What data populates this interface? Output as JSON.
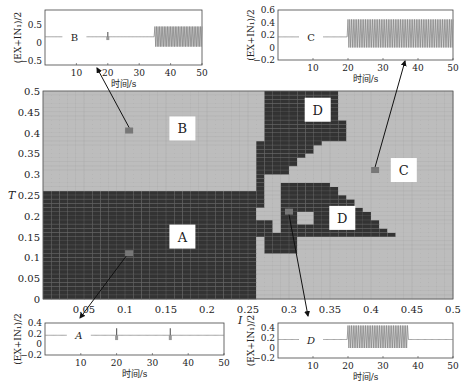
{
  "chart_data": [
    {
      "id": "main",
      "type": "heatmap",
      "title": "",
      "xlabel": "I",
      "ylabel": "T",
      "xlim": [
        0,
        0.5
      ],
      "ylim": [
        0,
        0.5
      ],
      "xticks": [
        "0.05",
        "0.1",
        "0.15",
        "0.2",
        "0.25",
        "0.3",
        "0.35",
        "0.4",
        "0.45",
        "0.5"
      ],
      "yticks": [
        "0",
        "0.05",
        "0.1",
        "0.15",
        "0.2",
        "0.25",
        "0.3",
        "0.35",
        "0.4",
        "0.45",
        "0.5"
      ],
      "grid": true,
      "colors": {
        "light": "#bdbdbd",
        "dark": "#333333",
        "marker": "#777777",
        "grid": "#9a9a9a"
      },
      "regions": [
        {
          "label": "A",
          "description": "dark region, I 0–0.26, T 0–0.26",
          "label_pos": [
            0.17,
            0.15
          ]
        },
        {
          "label": "B",
          "description": "light region, I 0–0.26, T 0.26–0.5",
          "label_pos": [
            0.17,
            0.41
          ]
        },
        {
          "label": "C",
          "description": "light region right side",
          "label_pos": [
            0.44,
            0.31
          ]
        },
        {
          "label": "D",
          "description": "dark upper blob, I ~0.27–0.37, T ~0.28–0.5",
          "label_pos": [
            0.335,
            0.455
          ]
        },
        {
          "label": "D",
          "description": "dark lower triangle, I ~0.29–0.43, T ~0.14–0.28",
          "label_pos": [
            0.365,
            0.195
          ]
        }
      ],
      "markers": [
        {
          "for": "B",
          "I": 0.105,
          "T": 0.405
        },
        {
          "for": "C",
          "I": 0.405,
          "T": 0.31
        },
        {
          "for": "D",
          "I": 0.3,
          "T": 0.21
        },
        {
          "for": "A",
          "I": 0.105,
          "T": 0.11
        }
      ]
    },
    {
      "id": "inset-B",
      "type": "line",
      "label": "B",
      "xlabel": "时间/s",
      "ylabel": "(EX+IN₁)/2",
      "xlim": [
        0,
        50
      ],
      "ylim": [
        -0.6,
        0.9
      ],
      "xticks": [
        "10",
        "20",
        "30",
        "40",
        "50"
      ],
      "yticks": [
        "0.5",
        "0",
        "−0.5"
      ],
      "description": "flat ~0.15 until 35 s (small blip at 20 s), then sustained oscillation between ~-0.1 and ~0.45"
    },
    {
      "id": "inset-C",
      "type": "line",
      "label": "C",
      "xlabel": "时间/s",
      "ylabel": "(EX+IN₁)/2",
      "xlim": [
        0,
        50
      ],
      "ylim": [
        -0.2,
        0.6
      ],
      "xticks": [
        "10",
        "20",
        "30",
        "40",
        "50"
      ],
      "yticks": [
        "0.6",
        "0.4",
        "0.2",
        "0",
        "−0.2"
      ],
      "description": "flat ~0.17 until 20 s, then sustained oscillation between ~0.0 and ~0.45 with dip at 35 s"
    },
    {
      "id": "inset-A",
      "type": "line",
      "label": "A",
      "xlabel": "时间/s",
      "ylabel": "(EX+IN₁)/2",
      "xlim": [
        0,
        50
      ],
      "ylim": [
        -0.2,
        0.4
      ],
      "xticks": [
        "10",
        "20",
        "30",
        "40",
        "50"
      ],
      "yticks": [
        "0.4",
        "0.2",
        "0",
        "−0.2"
      ],
      "description": "flat ~0.17 with transient spikes at 20 s and 35 s returning to rest"
    },
    {
      "id": "inset-D",
      "type": "line",
      "label": "D",
      "xlabel": "时间/s",
      "ylabel": "(EX+IN₁)/2",
      "xlim": [
        0,
        50
      ],
      "ylim": [
        -0.2,
        0.5
      ],
      "xticks": [
        "10",
        "20",
        "30",
        "40",
        "50"
      ],
      "yticks": [
        "0.4",
        "0.2",
        "0",
        "−0.2"
      ],
      "description": "flat ~0.17 until 20 s, oscillation ~0.0–0.45 from 20 s to ~37 s, then decays to rest"
    }
  ],
  "labels": {
    "xlabel": "I",
    "ylabel": "T",
    "inset_xlabel": "时间/s",
    "inset_ylabel": "(EX+IN₁)/2",
    "A": "A",
    "B": "B",
    "C": "C",
    "D": "D"
  }
}
